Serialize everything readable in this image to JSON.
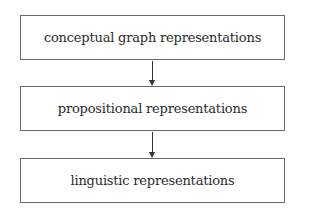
{
  "diagram": {
    "type": "flowchart",
    "direction": "top-to-bottom",
    "nodes": [
      {
        "id": "n1",
        "label": "conceptual graph representations"
      },
      {
        "id": "n2",
        "label": "propositional representations"
      },
      {
        "id": "n3",
        "label": "linguistic representations"
      }
    ],
    "edges": [
      {
        "from": "n1",
        "to": "n2"
      },
      {
        "from": "n2",
        "to": "n3"
      }
    ]
  }
}
